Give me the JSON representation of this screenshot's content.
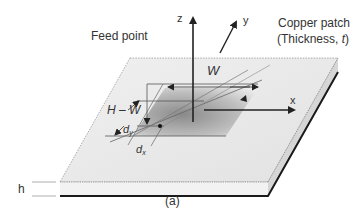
{
  "figure": {
    "caption": "(a)",
    "labels": {
      "feed_point": "Feed point",
      "copper_patch_line1": "Copper patch",
      "copper_patch_line2": "(Thickness, ",
      "copper_patch_t": "t",
      "copper_patch_close": ")",
      "width": "W",
      "length": "H – W",
      "d_y_main": "d",
      "d_y_sub": "y",
      "d_x_main": "d",
      "d_x_sub": "x",
      "substrate_height": "h",
      "axis_x": "x",
      "axis_y": "y",
      "axis_z": "z"
    },
    "colors": {
      "substrate_top": "#ececec",
      "substrate_edge": "#d9d9d9",
      "ground_plane": "#1a1a1a",
      "patch_dark": "#8c8c8c",
      "patch_light": "#e8e8e8",
      "line": "#555555",
      "axis": "#222222"
    }
  }
}
